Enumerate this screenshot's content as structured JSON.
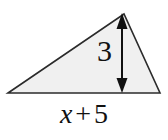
{
  "figure": {
    "kind": "geometry-triangle-diagram",
    "canvas": {
      "width": 168,
      "height": 140,
      "background": "#ffffff"
    },
    "triangle": {
      "fill": "#f0f0f0",
      "stroke": "#2b2b2b",
      "stroke_width": 1.6,
      "vertices": [
        {
          "name": "left-base-vertex",
          "x": 8,
          "y": 93
        },
        {
          "name": "apex-vertex",
          "x": 124,
          "y": 14
        },
        {
          "name": "right-base-vertex",
          "x": 160,
          "y": 93
        }
      ]
    },
    "height_arrow": {
      "color": "#111111",
      "x": 122,
      "y_top": 15,
      "y_bottom": 92,
      "double_headed": true
    },
    "labels": {
      "height": "3",
      "base_variable": "x",
      "base_operator": "+",
      "base_constant": "5",
      "base_full": "x + 5"
    }
  },
  "chart_data": {
    "type": "diagram",
    "title": "",
    "shape": "triangle",
    "measurements": [
      {
        "label": "height",
        "value": "3",
        "orientation": "vertical",
        "annotation": "double-headed arrow from apex to base"
      },
      {
        "label": "base",
        "value": "x + 5",
        "orientation": "horizontal",
        "annotation": "expression below base line"
      }
    ]
  }
}
